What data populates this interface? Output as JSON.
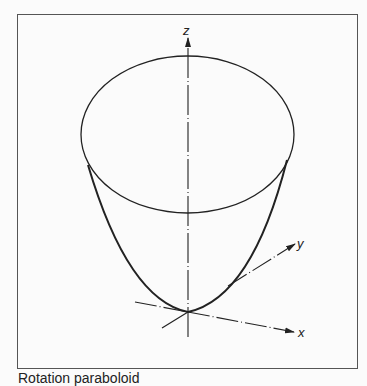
{
  "figure": {
    "caption": "Rotation paraboloid",
    "axes": {
      "z_label": "z",
      "y_label": "y",
      "x_label": "x"
    },
    "shape": "paraboloid of revolution",
    "colors": {
      "line": "#222222",
      "frame": "#555555",
      "background": "#fbfbfb"
    }
  }
}
